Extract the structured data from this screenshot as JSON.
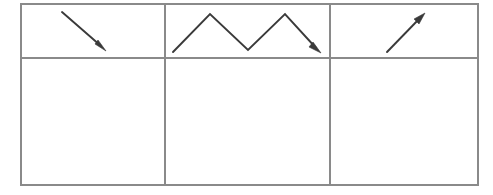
{
  "document": {
    "title": "Arrow trend table",
    "background_color": "#ffffff",
    "width": 493,
    "height": 195
  },
  "table": {
    "name": "arrow-trend-table",
    "columns": 3,
    "rows": 2,
    "border_color": "#8a8a8a",
    "border_width": 1.5,
    "bounds": {
      "left": 21,
      "top": 4,
      "right": 478,
      "bottom": 185
    },
    "column_dividers": [
      165,
      330
    ],
    "row_dividers": [
      58
    ],
    "cells": [
      {
        "id": "cell-r1c1",
        "row": 1,
        "column": 1,
        "content_type": "arrow",
        "icon": "arrow-down-right-icon",
        "label": "",
        "empty": false
      },
      {
        "id": "cell-r1c2",
        "row": 1,
        "column": 2,
        "content_type": "arrow",
        "icon": "zigzag-arrow-icon",
        "label": "",
        "empty": false
      },
      {
        "id": "cell-r1c3",
        "row": 1,
        "column": 3,
        "content_type": "arrow",
        "icon": "arrow-up-right-icon",
        "label": "",
        "empty": false
      },
      {
        "id": "cell-r2c1",
        "row": 2,
        "column": 1,
        "content_type": "empty",
        "icon": "",
        "label": "",
        "empty": true
      },
      {
        "id": "cell-r2c2",
        "row": 2,
        "column": 2,
        "content_type": "empty",
        "icon": "",
        "label": "",
        "empty": true
      },
      {
        "id": "cell-r2c3",
        "row": 2,
        "column": 3,
        "content_type": "empty",
        "icon": "",
        "label": "",
        "empty": true
      }
    ]
  },
  "arrows": {
    "stroke_color": "#3a3a3a",
    "stroke_width": 1.9,
    "items": [
      {
        "name": "arrow-down-right-icon",
        "direction": "down-right",
        "points": "62,12 101,46",
        "head_tip": "106,51",
        "head_polygon": "106,51 95,44 98,40",
        "cell": "cell-r1c1"
      },
      {
        "name": "zigzag-arrow-icon",
        "direction": "zigzag-down-end",
        "points": "173,52 210,14 248,50 285,14 316,48",
        "head_tip": "321,53",
        "head_polygon": "321,53 309,47 313,42",
        "cell": "cell-r1c2"
      },
      {
        "name": "arrow-up-right-icon",
        "direction": "up-right",
        "points": "387,52 420,18",
        "head_tip": "425,13",
        "head_polygon": "425,13 414,19 419,24",
        "cell": "cell-r1c3"
      }
    ]
  }
}
